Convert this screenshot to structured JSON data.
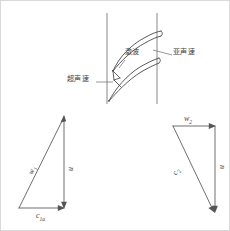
{
  "figure": {
    "title": "",
    "background_color": "#ffffff",
    "line_color": "#4a4a4a",
    "border_color": "#d9d9d9"
  },
  "cascade": {
    "annotations": [
      {
        "id": "shock",
        "label": "激波",
        "x": 124,
        "y": 52
      },
      {
        "id": "subsonic",
        "label": "亚声速",
        "x": 172,
        "y": 52
      },
      {
        "id": "supersonic",
        "label": "超声速",
        "x": 68,
        "y": 78
      }
    ],
    "leader_lines": [
      {
        "id": "subsonic-leader",
        "from_x": 170,
        "from_y": 55,
        "to_x": 150,
        "to_y": 50
      },
      {
        "id": "supersonic-leader",
        "from_x": 94,
        "from_y": 81,
        "to_x": 113,
        "to_y": 81
      },
      {
        "id": "shock-leader",
        "from_x": 122,
        "from_y": 58,
        "to_x": 116,
        "to_y": 66
      }
    ],
    "boundary_lines": [
      {
        "id": "left-boundary",
        "x": 106,
        "y1": 12,
        "y2": 103
      },
      {
        "id": "right-boundary",
        "x": 156,
        "y1": 12,
        "y2": 103
      }
    ]
  },
  "inlet_triangle": {
    "name": "inlet-velocity-triangle",
    "vectors": [
      {
        "id": "w1",
        "label": "w",
        "sub": "1",
        "x": 26,
        "y": 168
      },
      {
        "id": "u1",
        "label": "u",
        "sub": "",
        "x": 66,
        "y": 167
      },
      {
        "id": "c1a",
        "label": "c",
        "sub": "1a",
        "x": 38,
        "y": 216
      }
    ],
    "geometry": {
      "apex_x": 63,
      "apex_y": 114,
      "base_left_x": 18,
      "base_left_y": 207,
      "base_right_x": 63,
      "base_right_y": 207
    }
  },
  "outlet_triangle": {
    "name": "outlet-velocity-triangle",
    "vectors": [
      {
        "id": "w2",
        "label": "w",
        "sub": "2",
        "x": 184,
        "y": 114
      },
      {
        "id": "u2",
        "label": "u",
        "sub": "",
        "x": 216,
        "y": 163
      },
      {
        "id": "c2",
        "label": "c",
        "sub": "2",
        "x": 169,
        "y": 168
      }
    ],
    "geometry": {
      "top_left_x": 172,
      "top_left_y": 125,
      "top_right_x": 214,
      "top_right_y": 125,
      "bottom_x": 214,
      "bottom_y": 211
    }
  }
}
